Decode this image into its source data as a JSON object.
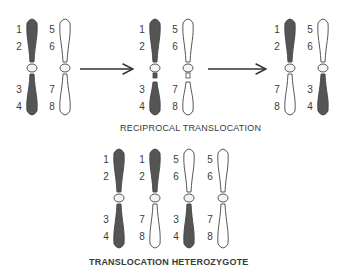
{
  "top_caption": "RECIPROCAL TRANSLOCATION",
  "bottom_caption": "TRANSLOCATION HETEROZYGOTE",
  "colors": {
    "dark": "#555555",
    "light": "#ffffff",
    "outline": "#444444"
  },
  "stages": [
    {
      "name": "before",
      "chromosomes": [
        {
          "x": 32,
          "upper": "dark",
          "lower": "dark",
          "labels": [
            "1",
            "2",
            "3",
            "4"
          ]
        },
        {
          "x": 65,
          "upper": "light",
          "lower": "light",
          "labels": [
            "5",
            "6",
            "7",
            "8"
          ]
        }
      ]
    },
    {
      "name": "break",
      "chromosomes": [
        {
          "x": 155,
          "upper": "dark",
          "lower": "dark",
          "labels": [
            "1",
            "2",
            "3",
            "4"
          ]
        },
        {
          "x": 188,
          "upper": "light",
          "lower": "light",
          "labels": [
            "5",
            "6",
            "7",
            "8"
          ]
        }
      ]
    },
    {
      "name": "after",
      "chromosomes": [
        {
          "x": 290,
          "upper": "dark",
          "lower": "light",
          "labels": [
            "1",
            "2",
            "7",
            "8"
          ]
        },
        {
          "x": 323,
          "upper": "light",
          "lower": "dark",
          "labels": [
            "5",
            "6",
            "3",
            "4"
          ]
        }
      ]
    }
  ],
  "heterozygote": [
    {
      "x": 119,
      "upper": "dark",
      "lower": "dark",
      "labels": [
        "1",
        "2",
        "3",
        "4"
      ]
    },
    {
      "x": 155,
      "upper": "dark",
      "lower": "light",
      "labels": [
        "1",
        "2",
        "7",
        "8"
      ]
    },
    {
      "x": 189,
      "upper": "light",
      "lower": "dark",
      "labels": [
        "5",
        "6",
        "3",
        "4"
      ]
    },
    {
      "x": 223,
      "upper": "light",
      "lower": "light",
      "labels": [
        "5",
        "6",
        "7",
        "8"
      ]
    }
  ]
}
